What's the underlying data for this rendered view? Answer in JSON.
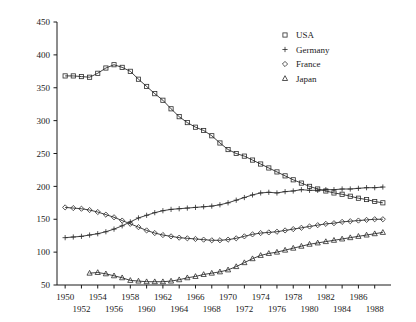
{
  "chart_data": {
    "type": "line",
    "title": "",
    "subtitle": "",
    "xlabel": "",
    "ylabel": "",
    "xlim": [
      1949,
      1990
    ],
    "ylim": [
      50,
      450
    ],
    "y_ticks": [
      50,
      100,
      150,
      200,
      250,
      300,
      350,
      400,
      450
    ],
    "x_ticks": [
      1950,
      1952,
      1954,
      1956,
      1958,
      1960,
      1962,
      1964,
      1966,
      1968,
      1970,
      1972,
      1974,
      1976,
      1978,
      1980,
      1982,
      1984,
      1986,
      1988
    ],
    "x_tick_labels_top": [
      "1950",
      "1954",
      "1958",
      "1962",
      "1966",
      "1970",
      "1974",
      "1978",
      "1982",
      "1986"
    ],
    "x_tick_labels_bottom": [
      "1952",
      "1956",
      "1960",
      "1964",
      "1968",
      "1972",
      "1976",
      "1980",
      "1984",
      "1988"
    ],
    "grid": false,
    "legend_position": "top-right",
    "legend": [
      "USA",
      "Germany",
      "France",
      "Japan"
    ],
    "series": [
      {
        "name": "USA",
        "marker": "square",
        "x": [
          1950,
          1951,
          1952,
          1953,
          1954,
          1955,
          1956,
          1957,
          1958,
          1959,
          1960,
          1961,
          1962,
          1963,
          1964,
          1965,
          1966,
          1967,
          1968,
          1969,
          1970,
          1971,
          1972,
          1973,
          1974,
          1975,
          1976,
          1977,
          1978,
          1979,
          1980,
          1981,
          1982,
          1983,
          1984,
          1985,
          1986,
          1987,
          1988,
          1989
        ],
        "values": [
          368,
          368,
          367,
          366,
          372,
          380,
          385,
          381,
          375,
          363,
          352,
          341,
          331,
          318,
          306,
          297,
          290,
          285,
          277,
          266,
          256,
          250,
          246,
          240,
          234,
          228,
          222,
          216,
          210,
          205,
          200,
          196,
          193,
          190,
          188,
          185,
          182,
          180,
          177,
          175
        ]
      },
      {
        "name": "Germany",
        "marker": "plus",
        "x": [
          1950,
          1951,
          1952,
          1953,
          1954,
          1955,
          1956,
          1957,
          1958,
          1959,
          1960,
          1961,
          1962,
          1963,
          1964,
          1965,
          1966,
          1967,
          1968,
          1969,
          1970,
          1971,
          1972,
          1973,
          1974,
          1975,
          1976,
          1977,
          1978,
          1979,
          1980,
          1981,
          1982,
          1983,
          1984,
          1985,
          1986,
          1987,
          1988,
          1989
        ],
        "values": [
          122,
          123,
          124,
          126,
          128,
          131,
          135,
          140,
          146,
          152,
          156,
          160,
          163,
          165,
          166,
          167,
          168,
          169,
          170,
          172,
          175,
          179,
          183,
          187,
          190,
          191,
          190,
          192,
          193,
          195,
          194,
          194,
          195,
          195,
          196,
          196,
          197,
          198,
          198,
          199
        ]
      },
      {
        "name": "France",
        "marker": "diamond",
        "x": [
          1950,
          1951,
          1952,
          1953,
          1954,
          1955,
          1956,
          1957,
          1958,
          1959,
          1960,
          1961,
          1962,
          1963,
          1964,
          1965,
          1966,
          1967,
          1968,
          1969,
          1970,
          1971,
          1972,
          1973,
          1974,
          1975,
          1976,
          1977,
          1978,
          1979,
          1980,
          1981,
          1982,
          1983,
          1984,
          1985,
          1986,
          1987,
          1988,
          1989
        ],
        "values": [
          168,
          167,
          166,
          164,
          161,
          157,
          153,
          148,
          143,
          138,
          133,
          129,
          126,
          124,
          122,
          121,
          120,
          119,
          118,
          118,
          119,
          121,
          124,
          127,
          129,
          130,
          131,
          133,
          135,
          137,
          139,
          141,
          143,
          144,
          146,
          147,
          148,
          149,
          150,
          150
        ]
      },
      {
        "name": "Japan",
        "marker": "triangle",
        "x": [
          1953,
          1954,
          1955,
          1956,
          1957,
          1958,
          1959,
          1960,
          1961,
          1962,
          1963,
          1964,
          1965,
          1966,
          1967,
          1968,
          1969,
          1970,
          1971,
          1972,
          1973,
          1974,
          1975,
          1976,
          1977,
          1978,
          1979,
          1980,
          1981,
          1982,
          1983,
          1984,
          1985,
          1986,
          1987,
          1988,
          1989
        ],
        "values": [
          68,
          69,
          67,
          64,
          61,
          57,
          56,
          55,
          55,
          55,
          56,
          58,
          61,
          63,
          66,
          68,
          70,
          73,
          78,
          84,
          90,
          95,
          98,
          100,
          103,
          106,
          109,
          112,
          114,
          116,
          118,
          120,
          122,
          124,
          126,
          128,
          130
        ]
      }
    ]
  },
  "legend": {
    "items": [
      {
        "label": "USA",
        "marker": "square"
      },
      {
        "label": "Germany",
        "marker": "plus"
      },
      {
        "label": "France",
        "marker": "diamond"
      },
      {
        "label": "Japan",
        "marker": "triangle"
      }
    ]
  }
}
